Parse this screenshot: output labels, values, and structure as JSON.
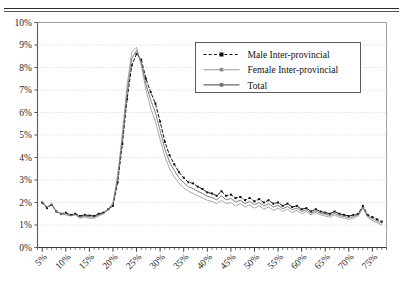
{
  "figure": {
    "caption_clipped": "",
    "background": "#ffffff",
    "border_color": "#2b2b2b"
  },
  "chart_data": {
    "type": "line",
    "title": "",
    "xlabel": "",
    "ylabel": "",
    "xlim": [
      4,
      78
    ],
    "ylim": [
      0,
      10
    ],
    "xtick_labels": [
      "5%",
      "10%",
      "15%",
      "20%",
      "25%",
      "30%",
      "35%",
      "40%",
      "45%",
      "50%",
      "55%",
      "60%",
      "65%",
      "70%",
      "75%"
    ],
    "xtick_values": [
      5,
      10,
      15,
      20,
      25,
      30,
      35,
      40,
      45,
      50,
      55,
      60,
      65,
      70,
      75
    ],
    "ytick_labels": [
      "0%",
      "1%",
      "2%",
      "3%",
      "4%",
      "5%",
      "6%",
      "7%",
      "8%",
      "9%",
      "10%"
    ],
    "ytick_values": [
      0,
      1,
      2,
      3,
      4,
      5,
      6,
      7,
      8,
      9,
      10
    ],
    "grid": "horizontal-dashed",
    "legend_position": "upper-center-right",
    "x": [
      5,
      6,
      7,
      8,
      9,
      10,
      11,
      12,
      13,
      14,
      15,
      16,
      17,
      18,
      19,
      20,
      21,
      22,
      23,
      24,
      25,
      26,
      27,
      28,
      29,
      30,
      31,
      32,
      33,
      34,
      35,
      36,
      37,
      38,
      39,
      40,
      41,
      42,
      43,
      44,
      45,
      46,
      47,
      48,
      49,
      50,
      51,
      52,
      53,
      54,
      55,
      56,
      57,
      58,
      59,
      60,
      61,
      62,
      63,
      64,
      65,
      66,
      67,
      68,
      69,
      70,
      71,
      72,
      73,
      74,
      75,
      76,
      77
    ],
    "series": [
      {
        "name": "Male Inter-provincial",
        "style": "dashed",
        "color": "#111111",
        "marker": "square",
        "values": [
          2.0,
          1.75,
          1.9,
          1.6,
          1.5,
          1.55,
          1.45,
          1.5,
          1.4,
          1.45,
          1.42,
          1.4,
          1.5,
          1.55,
          1.7,
          1.85,
          2.9,
          4.6,
          6.6,
          8.1,
          8.6,
          8.35,
          7.5,
          6.9,
          6.4,
          5.6,
          4.7,
          4.1,
          3.7,
          3.35,
          3.1,
          2.9,
          2.85,
          2.7,
          2.6,
          2.45,
          2.4,
          2.3,
          2.5,
          2.3,
          2.35,
          2.2,
          2.25,
          2.1,
          2.2,
          2.05,
          2.15,
          2.0,
          2.1,
          1.95,
          2.0,
          1.85,
          1.95,
          1.8,
          1.85,
          1.7,
          1.75,
          1.6,
          1.7,
          1.6,
          1.55,
          1.5,
          1.6,
          1.5,
          1.45,
          1.4,
          1.45,
          1.5,
          1.85,
          1.45,
          1.35,
          1.25,
          1.15
        ]
      },
      {
        "name": "Female Inter-provincial",
        "style": "solid-light",
        "color": "#9a9a9a",
        "marker": "square-small",
        "values": [
          2.05,
          1.8,
          1.95,
          1.6,
          1.5,
          1.45,
          1.4,
          1.45,
          1.3,
          1.35,
          1.3,
          1.3,
          1.4,
          1.5,
          1.7,
          2.0,
          3.2,
          5.1,
          7.2,
          8.7,
          8.9,
          8.1,
          7.0,
          6.2,
          5.6,
          4.8,
          4.05,
          3.5,
          3.15,
          2.85,
          2.65,
          2.5,
          2.4,
          2.3,
          2.2,
          2.1,
          2.05,
          1.95,
          2.1,
          1.95,
          2.0,
          1.85,
          1.95,
          1.8,
          1.9,
          1.75,
          1.85,
          1.7,
          1.8,
          1.65,
          1.75,
          1.6,
          1.7,
          1.55,
          1.65,
          1.5,
          1.6,
          1.45,
          1.55,
          1.45,
          1.4,
          1.35,
          1.45,
          1.35,
          1.3,
          1.25,
          1.3,
          1.4,
          1.75,
          1.35,
          1.2,
          1.1,
          1.0
        ]
      },
      {
        "name": "Total",
        "style": "solid-dark",
        "color": "#6a6a6a",
        "marker": "square",
        "values": [
          2.02,
          1.78,
          1.92,
          1.6,
          1.5,
          1.5,
          1.42,
          1.47,
          1.35,
          1.4,
          1.36,
          1.35,
          1.45,
          1.52,
          1.7,
          1.92,
          3.05,
          4.85,
          6.9,
          8.4,
          8.75,
          8.22,
          7.25,
          6.55,
          6.0,
          5.2,
          4.38,
          3.8,
          3.42,
          3.1,
          2.88,
          2.7,
          2.62,
          2.5,
          2.4,
          2.28,
          2.22,
          2.12,
          2.3,
          2.12,
          2.18,
          2.02,
          2.1,
          1.95,
          2.05,
          1.9,
          2.0,
          1.85,
          1.95,
          1.8,
          1.88,
          1.72,
          1.82,
          1.68,
          1.75,
          1.6,
          1.68,
          1.52,
          1.62,
          1.52,
          1.48,
          1.42,
          1.52,
          1.42,
          1.38,
          1.32,
          1.38,
          1.45,
          1.8,
          1.4,
          1.28,
          1.18,
          1.08
        ]
      }
    ],
    "legend": [
      {
        "label": "Male Inter-provincial",
        "style": "dashed",
        "color": "#111111"
      },
      {
        "label": "Female Inter-provincial",
        "style": "solid-light",
        "color": "#9a9a9a"
      },
      {
        "label": "Total",
        "style": "solid-dark",
        "color": "#6a6a6a"
      }
    ]
  }
}
